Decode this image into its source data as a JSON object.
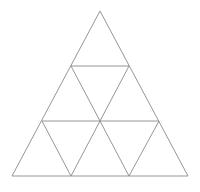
{
  "figure": {
    "name": "subdivided-equilateral-triangle",
    "background_color": "#ffffff",
    "stroke_color": "#8a8a8a",
    "stroke_width": 0.9,
    "canvas": {
      "width": 200,
      "height": 192
    },
    "rows": 3,
    "small_triangle_count": 9,
    "upward_triangle_count": 6,
    "downward_triangle_count": 3,
    "vertices": {
      "apex": {
        "x": 100,
        "y": 11
      },
      "bottom_left": {
        "x": 12,
        "y": 176
      },
      "bottom_right": {
        "x": 188,
        "y": 176
      },
      "row1_left": {
        "x": 71,
        "y": 66
      },
      "row1_right": {
        "x": 129,
        "y": 66
      },
      "row2_left": {
        "x": 42,
        "y": 121
      },
      "row2_mid": {
        "x": 100,
        "y": 121
      },
      "row2_right": {
        "x": 159,
        "y": 121
      },
      "base_mid_left": {
        "x": 71,
        "y": 176
      },
      "base_mid_right": {
        "x": 129,
        "y": 176
      }
    },
    "segments": [
      {
        "name": "outer-left-edge",
        "x1": 100,
        "y1": 11,
        "x2": 12,
        "y2": 176
      },
      {
        "name": "outer-right-edge",
        "x1": 100,
        "y1": 11,
        "x2": 188,
        "y2": 176
      },
      {
        "name": "outer-base-edge",
        "x1": 12,
        "y1": 176,
        "x2": 188,
        "y2": 176
      },
      {
        "name": "horizontal-row1",
        "x1": 71,
        "y1": 66,
        "x2": 129,
        "y2": 66
      },
      {
        "name": "horizontal-row2",
        "x1": 42,
        "y1": 121,
        "x2": 159,
        "y2": 121
      },
      {
        "name": "oblique-left-a",
        "x1": 71,
        "y1": 66,
        "x2": 129,
        "y2": 176
      },
      {
        "name": "oblique-left-b",
        "x1": 42,
        "y1": 121,
        "x2": 71,
        "y2": 176
      },
      {
        "name": "oblique-right-a",
        "x1": 129,
        "y1": 66,
        "x2": 71,
        "y2": 176
      },
      {
        "name": "oblique-right-b",
        "x1": 159,
        "y1": 121,
        "x2": 129,
        "y2": 176
      }
    ]
  }
}
